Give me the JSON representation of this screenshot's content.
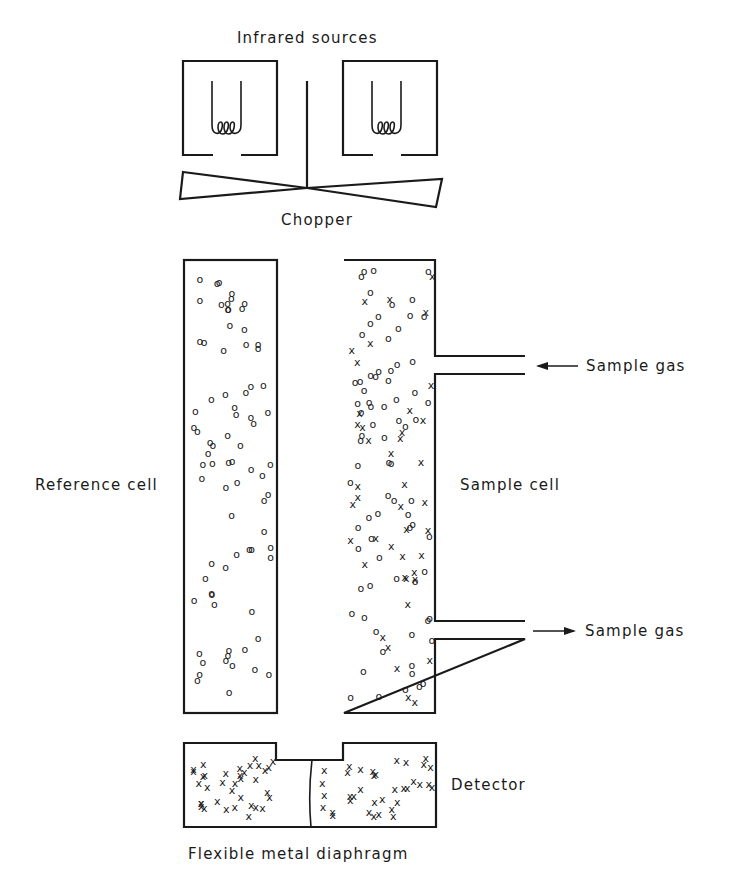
{
  "labels": {
    "infrared_sources": "Infrared sources",
    "chopper": "Chopper",
    "reference_cell": "Reference cell",
    "sample_cell": "Sample cell",
    "sample_gas_in": "Sample gas",
    "sample_gas_out": "Sample gas",
    "detector": "Detector",
    "diaphragm": "Flexible metal diaphragm"
  },
  "symbols": {
    "non_absorbing_molecule": "o",
    "absorbing_molecule": "x"
  },
  "colors": {
    "ink": "#1a1a1a",
    "background": "#ffffff"
  },
  "flows": [
    {
      "direction": "in",
      "arrow": "left"
    },
    {
      "direction": "out",
      "arrow": "right"
    }
  ]
}
